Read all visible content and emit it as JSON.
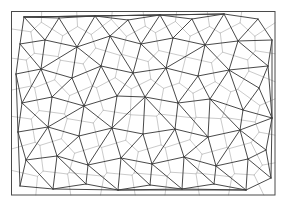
{
  "figure": {
    "type": "computational-geometry-diagram",
    "width": 286,
    "height": 211,
    "background_color": "#ffffff"
  },
  "frame": {
    "name": "bounding-rectangle",
    "x": 11.5,
    "y": 11.5,
    "width": 263.5,
    "height": 183.5,
    "stroke_color": "#4a4a4a",
    "stroke_width": 1.0,
    "fill": "none"
  },
  "delaunay": {
    "name": "delaunay-triangulation",
    "stroke_color": "#3f3f3f",
    "stroke_width": 0.95,
    "description": "Dark straight-line graph connecting neighbouring generator points"
  },
  "voronoi": {
    "name": "voronoi-diagram",
    "stroke_color": "#bcbcbc",
    "stroke_width": 0.8,
    "description": "Light grey dual cell boundaries, one convex cell per generator point"
  },
  "chart_data": {
    "type": "scatter",
    "xlabel": "",
    "ylabel": "",
    "xlim": [
      11.5,
      275
    ],
    "ylim": [
      11.5,
      195
    ],
    "grid": false,
    "legend": null,
    "series": [
      {
        "name": "generator-points",
        "marker": "delaunay-vertex",
        "points": [
          [
            24,
            17
          ],
          [
            59,
            18
          ],
          [
            95,
            16
          ],
          [
            128,
            20
          ],
          [
            160,
            15
          ],
          [
            192,
            19
          ],
          [
            224,
            14
          ],
          [
            258,
            19
          ],
          [
            272,
            40
          ],
          [
            20,
            44
          ],
          [
            45,
            40
          ],
          [
            77,
            47
          ],
          [
            110,
            36
          ],
          [
            141,
            44
          ],
          [
            173,
            38
          ],
          [
            205,
            45
          ],
          [
            238,
            41
          ],
          [
            268,
            66
          ],
          [
            16,
            74
          ],
          [
            41,
            69
          ],
          [
            72,
            78
          ],
          [
            101,
            66
          ],
          [
            133,
            73
          ],
          [
            166,
            68
          ],
          [
            198,
            76
          ],
          [
            229,
            70
          ],
          [
            259,
            88
          ],
          [
            22,
            103
          ],
          [
            52,
            97
          ],
          [
            84,
            106
          ],
          [
            117,
            96
          ],
          [
            145,
            97
          ],
          [
            178,
            103
          ],
          [
            210,
            99
          ],
          [
            243,
            110
          ],
          [
            272,
            118
          ],
          [
            18,
            132
          ],
          [
            48,
            127
          ],
          [
            79,
            136
          ],
          [
            112,
            128
          ],
          [
            143,
            134
          ],
          [
            175,
            129
          ],
          [
            208,
            137
          ],
          [
            240,
            130
          ],
          [
            266,
            150
          ],
          [
            26,
            160
          ],
          [
            57,
            156
          ],
          [
            88,
            165
          ],
          [
            121,
            158
          ],
          [
            152,
            164
          ],
          [
            184,
            157
          ],
          [
            216,
            166
          ],
          [
            248,
            159
          ],
          [
            20,
            186
          ],
          [
            53,
            189
          ],
          [
            86,
            184
          ],
          [
            118,
            190
          ],
          [
            150,
            185
          ],
          [
            182,
            189
          ],
          [
            214,
            184
          ],
          [
            246,
            190
          ],
          [
            271,
            178
          ]
        ]
      }
    ]
  }
}
